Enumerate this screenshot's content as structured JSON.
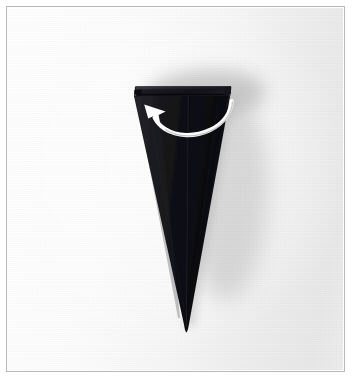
{
  "figure": {
    "kind": "photograph",
    "caption": "",
    "background_color": "#ffffff",
    "frame_border_color": "#b9b9b9",
    "model_color": "#111111",
    "arrow_color": "#ffffff",
    "shadow_color": "#9d9d9d"
  },
  "frame": {
    "x": 6,
    "y": 6,
    "width": 339,
    "height": 366,
    "border_width": 1
  },
  "model": {
    "name": "folded-paper-cone",
    "description": "Tall narrow dark cone tapering to a point, with a folded band across the top edge and a faint vertical center crease",
    "apex": {
      "x": 178,
      "y": 325
    },
    "top_left": {
      "x": 132,
      "y": 84
    },
    "top_right": {
      "x": 227,
      "y": 84
    },
    "top_band_height": 10,
    "center_crease_top": {
      "x": 180,
      "y": 86
    },
    "center_crease_bottom": {
      "x": 178,
      "y": 320
    }
  },
  "arrow": {
    "name": "fold-arrow",
    "style": "curved-solid-white",
    "direction": "right-to-left-sweeping-up",
    "head_tip": {
      "x": 141,
      "y": 99
    },
    "tail_end": {
      "x": 224,
      "y": 95
    },
    "stroke_width": 4
  },
  "annotations": {
    "step_number": "",
    "labels": []
  }
}
